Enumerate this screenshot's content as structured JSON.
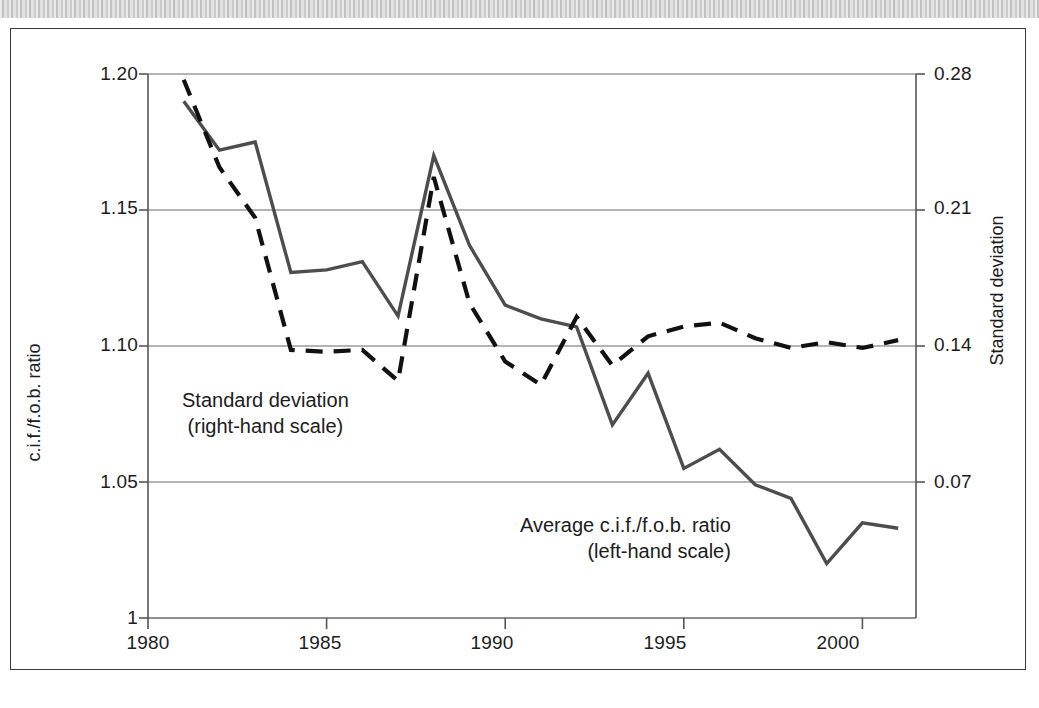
{
  "figure": {
    "background_band": "scanned-page-band",
    "frame_color": "#3a3a3a"
  },
  "axes": {
    "left": {
      "title": "c.i.f./f.o.b. ratio",
      "ticks": [
        "1.20",
        "1.15",
        "1.10",
        "1.05",
        "1"
      ],
      "values": [
        1.2,
        1.15,
        1.1,
        1.05,
        1.0
      ],
      "min": 1.0,
      "max": 1.2
    },
    "right": {
      "title": "Standard deviation",
      "ticks": [
        "0.28",
        "0.21",
        "0.14",
        "0.07"
      ],
      "values": [
        0.28,
        0.21,
        0.14,
        0.07
      ],
      "min": 0.0,
      "max": 0.28
    },
    "bottom": {
      "ticks": [
        "1980",
        "1985",
        "1990",
        "1995",
        "2000"
      ],
      "values": [
        1980,
        1985,
        1990,
        1995,
        2000
      ],
      "min": 1980,
      "max": 2001.5
    }
  },
  "annotations": {
    "standard_deviation": {
      "line1": "Standard deviation",
      "line2": "(right-hand scale)"
    },
    "average_ratio": {
      "line1": "Average c.i.f./f.o.b. ratio",
      "line2": "(left-hand scale)"
    }
  },
  "chart_data": {
    "type": "line",
    "title": "",
    "xlabel": "",
    "ylabel": "c.i.f./f.o.b. ratio",
    "y2label": "Standard deviation",
    "xlim": [
      1980,
      2001.5
    ],
    "ylim": [
      1.0,
      1.2
    ],
    "y2lim": [
      0.0,
      0.28
    ],
    "grid": true,
    "grid_axis": "y",
    "legend": "inline-annotations",
    "x": [
      1981,
      1982,
      1983,
      1984,
      1985,
      1986,
      1987,
      1988,
      1989,
      1990,
      1991,
      1992,
      1993,
      1994,
      1995,
      1996,
      1997,
      1998,
      1999,
      2000,
      2001
    ],
    "series": [
      {
        "name": "Average c.i.f./f.o.b. ratio",
        "axis": "left",
        "style": "solid",
        "color": "#4d4d4d",
        "values": [
          1.19,
          1.172,
          1.175,
          1.127,
          1.128,
          1.131,
          1.111,
          1.17,
          1.137,
          1.115,
          1.11,
          1.107,
          1.071,
          1.09,
          1.055,
          1.062,
          1.049,
          1.044,
          1.02,
          1.035,
          1.033
        ]
      },
      {
        "name": "Standard deviation",
        "axis": "right",
        "style": "dashed",
        "color": "#111111",
        "values": [
          0.277,
          0.232,
          0.206,
          0.138,
          0.137,
          0.138,
          0.122,
          0.227,
          0.162,
          0.132,
          0.12,
          0.155,
          0.13,
          0.145,
          0.15,
          0.152,
          0.144,
          0.139,
          0.142,
          0.139,
          0.143
        ]
      }
    ]
  }
}
